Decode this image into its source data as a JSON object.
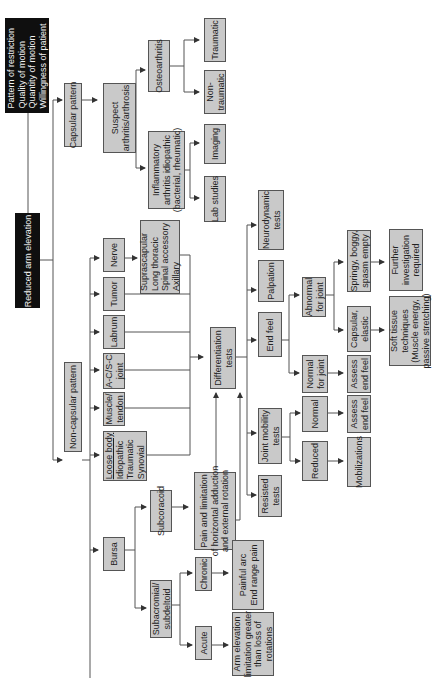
{
  "diagram": {
    "orientation": "rotated 90 degrees counter-clockwise",
    "root": "Reduced arm elevation",
    "criteria": "Pattern of restriction\nQuality of motion\nQuantity of motion\nWillingness of patient",
    "capsular_pattern": "Capsular pattern",
    "suspect_arthritis": "Suspect\narthritis/arthrosis",
    "osteoarthritis": "Osteoarthritis",
    "traumatic": "Traumatic",
    "non_traumatic": "Non-\ntraumatic",
    "inflammatory_arthritis": "Inflammatory\narthritis idiopathic\n(bacterial, rheumatic)",
    "imaging": "Imaging",
    "lab_studies": "Lab studies",
    "non_capsular_pattern": "Non-capsular pattern",
    "nerve": "Nerve",
    "nerve_list": "Suprascapular\nLong thoracic\nSpinal accessory\nAxillary",
    "tumor": "Tumor",
    "labrum": "Labrum",
    "ac_sc_joint": "A-C/S-C\njoint",
    "muscle_tendon": "Muscle/\ntendon",
    "loose_body_title": "Loose body",
    "loose_body_list": "Idiopathic\nTraumatic\nSynovial",
    "bursa": "Bursa",
    "subcoracoid": "Subcoracoid",
    "subcoracoid_sign": "Pain and limitation\nof horizontal adduction\nand external rotation",
    "subacromial": "Subacromial/\nsubdeltoid",
    "chronic": "Chronic",
    "chronic_sign": "Painful arc\nEnd range pain",
    "acute": "Acute",
    "acute_sign": "Arm elevation\nlimitation greater\nthan loss of\nrotations",
    "differentiation_tests": "Differentiation\ntests",
    "neurodynamic_tests": "Neurodynamic\ntests",
    "palpation": "Palpation",
    "end_feel": "End feel",
    "abnormal_for_joint": "Abnormal\nfor joint",
    "springy": "Springy, boggy,\nspasm empty",
    "further_investigation": "Further\ninvestigation\nrequired",
    "capsular_elastic": "Capsular,\nelastic",
    "soft_tissue": "Soft tissue\ntechniques\n(Muscle energy,\npassive stretching)",
    "normal_for_joint": "Normal\nfor joint",
    "assess_end_feel_1": "Assess\nend feel",
    "joint_mobility_tests": "Joint mobility\ntests",
    "normal": "Normal",
    "assess_end_feel_2": "Assess\nend feel",
    "reduced": "Reduced",
    "mobilizations": "Mobilizations",
    "resisted_tests": "Resisted\ntests"
  },
  "colors": {
    "box_fill": "#c9c9c9",
    "dark_box": "#0f0f0f",
    "line": "#555555"
  }
}
